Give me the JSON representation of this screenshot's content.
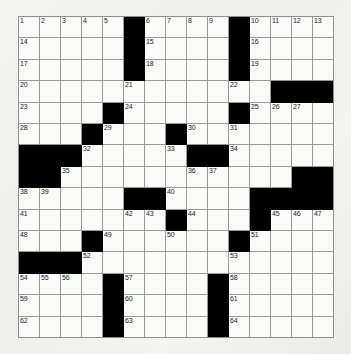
{
  "puzzle": {
    "title": "Crossword Puzzle Grid",
    "rows": 15,
    "columns": 15,
    "colors": {
      "block": "#000000",
      "cell": "#fafaf8",
      "gridline": "#9a9a9a",
      "page_background": "#f2f2f0",
      "number_text": "#222222"
    },
    "grid": [
      [
        {
          "type": "open",
          "number": "1"
        },
        {
          "type": "open",
          "number": "2"
        },
        {
          "type": "open",
          "number": "3"
        },
        {
          "type": "open",
          "number": "4"
        },
        {
          "type": "open",
          "number": "5"
        },
        {
          "type": "block",
          "number": ""
        },
        {
          "type": "open",
          "number": "6"
        },
        {
          "type": "open",
          "number": "7"
        },
        {
          "type": "open",
          "number": "8"
        },
        {
          "type": "open",
          "number": "9"
        },
        {
          "type": "block",
          "number": ""
        },
        {
          "type": "open",
          "number": "10"
        },
        {
          "type": "open",
          "number": "11"
        },
        {
          "type": "open",
          "number": "12"
        },
        {
          "type": "open",
          "number": "13"
        }
      ],
      [
        {
          "type": "open",
          "number": "14"
        },
        {
          "type": "open",
          "number": ""
        },
        {
          "type": "open",
          "number": ""
        },
        {
          "type": "open",
          "number": ""
        },
        {
          "type": "open",
          "number": ""
        },
        {
          "type": "block",
          "number": ""
        },
        {
          "type": "open",
          "number": "15"
        },
        {
          "type": "open",
          "number": ""
        },
        {
          "type": "open",
          "number": ""
        },
        {
          "type": "open",
          "number": ""
        },
        {
          "type": "block",
          "number": ""
        },
        {
          "type": "open",
          "number": "16"
        },
        {
          "type": "open",
          "number": ""
        },
        {
          "type": "open",
          "number": ""
        },
        {
          "type": "open",
          "number": ""
        }
      ],
      [
        {
          "type": "open",
          "number": "17"
        },
        {
          "type": "open",
          "number": ""
        },
        {
          "type": "open",
          "number": ""
        },
        {
          "type": "open",
          "number": ""
        },
        {
          "type": "open",
          "number": ""
        },
        {
          "type": "block",
          "number": ""
        },
        {
          "type": "open",
          "number": "18"
        },
        {
          "type": "open",
          "number": ""
        },
        {
          "type": "open",
          "number": ""
        },
        {
          "type": "open",
          "number": ""
        },
        {
          "type": "block",
          "number": ""
        },
        {
          "type": "open",
          "number": "19"
        },
        {
          "type": "open",
          "number": ""
        },
        {
          "type": "open",
          "number": ""
        },
        {
          "type": "open",
          "number": ""
        }
      ],
      [
        {
          "type": "open",
          "number": "20"
        },
        {
          "type": "open",
          "number": ""
        },
        {
          "type": "open",
          "number": ""
        },
        {
          "type": "open",
          "number": ""
        },
        {
          "type": "open",
          "number": ""
        },
        {
          "type": "open",
          "number": "21"
        },
        {
          "type": "open",
          "number": ""
        },
        {
          "type": "open",
          "number": ""
        },
        {
          "type": "open",
          "number": ""
        },
        {
          "type": "open",
          "number": ""
        },
        {
          "type": "open",
          "number": "22"
        },
        {
          "type": "open",
          "number": ""
        },
        {
          "type": "block",
          "number": ""
        },
        {
          "type": "block",
          "number": ""
        },
        {
          "type": "block",
          "number": ""
        }
      ],
      [
        {
          "type": "open",
          "number": "23"
        },
        {
          "type": "open",
          "number": ""
        },
        {
          "type": "open",
          "number": ""
        },
        {
          "type": "open",
          "number": ""
        },
        {
          "type": "block",
          "number": ""
        },
        {
          "type": "open",
          "number": "24"
        },
        {
          "type": "open",
          "number": ""
        },
        {
          "type": "open",
          "number": ""
        },
        {
          "type": "open",
          "number": ""
        },
        {
          "type": "open",
          "number": ""
        },
        {
          "type": "block",
          "number": ""
        },
        {
          "type": "open",
          "number": "25"
        },
        {
          "type": "open",
          "number": "26"
        },
        {
          "type": "open",
          "number": "27"
        },
        {
          "type": "open",
          "number": ""
        }
      ],
      [
        {
          "type": "open",
          "number": "28"
        },
        {
          "type": "open",
          "number": ""
        },
        {
          "type": "open",
          "number": ""
        },
        {
          "type": "block",
          "number": ""
        },
        {
          "type": "open",
          "number": "29"
        },
        {
          "type": "open",
          "number": ""
        },
        {
          "type": "open",
          "number": ""
        },
        {
          "type": "block",
          "number": ""
        },
        {
          "type": "open",
          "number": "30"
        },
        {
          "type": "open",
          "number": ""
        },
        {
          "type": "open",
          "number": "31"
        },
        {
          "type": "open",
          "number": ""
        },
        {
          "type": "open",
          "number": ""
        },
        {
          "type": "open",
          "number": ""
        },
        {
          "type": "open",
          "number": ""
        }
      ],
      [
        {
          "type": "block",
          "number": ""
        },
        {
          "type": "block",
          "number": ""
        },
        {
          "type": "block",
          "number": ""
        },
        {
          "type": "open",
          "number": "32"
        },
        {
          "type": "open",
          "number": ""
        },
        {
          "type": "open",
          "number": ""
        },
        {
          "type": "open",
          "number": ""
        },
        {
          "type": "open",
          "number": "33"
        },
        {
          "type": "block",
          "number": ""
        },
        {
          "type": "block",
          "number": ""
        },
        {
          "type": "open",
          "number": "34"
        },
        {
          "type": "open",
          "number": ""
        },
        {
          "type": "open",
          "number": ""
        },
        {
          "type": "open",
          "number": ""
        },
        {
          "type": "open",
          "number": ""
        }
      ],
      [
        {
          "type": "block",
          "number": ""
        },
        {
          "type": "block",
          "number": ""
        },
        {
          "type": "open",
          "number": "35"
        },
        {
          "type": "open",
          "number": ""
        },
        {
          "type": "open",
          "number": ""
        },
        {
          "type": "open",
          "number": ""
        },
        {
          "type": "open",
          "number": ""
        },
        {
          "type": "open",
          "number": ""
        },
        {
          "type": "open",
          "number": "36"
        },
        {
          "type": "open",
          "number": "37"
        },
        {
          "type": "open",
          "number": ""
        },
        {
          "type": "open",
          "number": ""
        },
        {
          "type": "open",
          "number": ""
        },
        {
          "type": "block",
          "number": ""
        },
        {
          "type": "block",
          "number": ""
        }
      ],
      [
        {
          "type": "open",
          "number": "38"
        },
        {
          "type": "open",
          "number": "39"
        },
        {
          "type": "open",
          "number": ""
        },
        {
          "type": "open",
          "number": ""
        },
        {
          "type": "open",
          "number": ""
        },
        {
          "type": "block",
          "number": ""
        },
        {
          "type": "block",
          "number": ""
        },
        {
          "type": "open",
          "number": "40"
        },
        {
          "type": "open",
          "number": ""
        },
        {
          "type": "open",
          "number": ""
        },
        {
          "type": "open",
          "number": ""
        },
        {
          "type": "block",
          "number": ""
        },
        {
          "type": "block",
          "number": ""
        },
        {
          "type": "block",
          "number": ""
        },
        {
          "type": "block",
          "number": ""
        }
      ],
      [
        {
          "type": "open",
          "number": "41"
        },
        {
          "type": "open",
          "number": ""
        },
        {
          "type": "open",
          "number": ""
        },
        {
          "type": "open",
          "number": ""
        },
        {
          "type": "open",
          "number": ""
        },
        {
          "type": "open",
          "number": "42"
        },
        {
          "type": "open",
          "number": "43"
        },
        {
          "type": "block",
          "number": ""
        },
        {
          "type": "open",
          "number": "44"
        },
        {
          "type": "open",
          "number": ""
        },
        {
          "type": "open",
          "number": ""
        },
        {
          "type": "block",
          "number": ""
        },
        {
          "type": "open",
          "number": "45"
        },
        {
          "type": "open",
          "number": "46"
        },
        {
          "type": "open",
          "number": "47"
        }
      ],
      [
        {
          "type": "open",
          "number": "48"
        },
        {
          "type": "open",
          "number": ""
        },
        {
          "type": "open",
          "number": ""
        },
        {
          "type": "block",
          "number": ""
        },
        {
          "type": "open",
          "number": "49"
        },
        {
          "type": "open",
          "number": ""
        },
        {
          "type": "open",
          "number": ""
        },
        {
          "type": "open",
          "number": "50"
        },
        {
          "type": "open",
          "number": ""
        },
        {
          "type": "open",
          "number": ""
        },
        {
          "type": "block",
          "number": ""
        },
        {
          "type": "open",
          "number": "51"
        },
        {
          "type": "open",
          "number": ""
        },
        {
          "type": "open",
          "number": ""
        },
        {
          "type": "open",
          "number": ""
        }
      ],
      [
        {
          "type": "block",
          "number": ""
        },
        {
          "type": "block",
          "number": ""
        },
        {
          "type": "block",
          "number": ""
        },
        {
          "type": "open",
          "number": "52"
        },
        {
          "type": "open",
          "number": ""
        },
        {
          "type": "open",
          "number": ""
        },
        {
          "type": "open",
          "number": ""
        },
        {
          "type": "open",
          "number": ""
        },
        {
          "type": "open",
          "number": ""
        },
        {
          "type": "open",
          "number": ""
        },
        {
          "type": "open",
          "number": "53"
        },
        {
          "type": "open",
          "number": ""
        },
        {
          "type": "open",
          "number": ""
        },
        {
          "type": "open",
          "number": ""
        },
        {
          "type": "open",
          "number": ""
        }
      ],
      [
        {
          "type": "open",
          "number": "54"
        },
        {
          "type": "open",
          "number": "55"
        },
        {
          "type": "open",
          "number": "56"
        },
        {
          "type": "open",
          "number": ""
        },
        {
          "type": "block",
          "number": ""
        },
        {
          "type": "open",
          "number": "57"
        },
        {
          "type": "open",
          "number": ""
        },
        {
          "type": "open",
          "number": ""
        },
        {
          "type": "open",
          "number": ""
        },
        {
          "type": "block",
          "number": ""
        },
        {
          "type": "open",
          "number": "58"
        },
        {
          "type": "open",
          "number": ""
        },
        {
          "type": "open",
          "number": ""
        },
        {
          "type": "open",
          "number": ""
        },
        {
          "type": "open",
          "number": ""
        }
      ],
      [
        {
          "type": "open",
          "number": "59"
        },
        {
          "type": "open",
          "number": ""
        },
        {
          "type": "open",
          "number": ""
        },
        {
          "type": "open",
          "number": ""
        },
        {
          "type": "block",
          "number": ""
        },
        {
          "type": "open",
          "number": "60"
        },
        {
          "type": "open",
          "number": ""
        },
        {
          "type": "open",
          "number": ""
        },
        {
          "type": "open",
          "number": ""
        },
        {
          "type": "block",
          "number": ""
        },
        {
          "type": "open",
          "number": "61"
        },
        {
          "type": "open",
          "number": ""
        },
        {
          "type": "open",
          "number": ""
        },
        {
          "type": "open",
          "number": ""
        },
        {
          "type": "open",
          "number": ""
        }
      ],
      [
        {
          "type": "open",
          "number": "62"
        },
        {
          "type": "open",
          "number": ""
        },
        {
          "type": "open",
          "number": ""
        },
        {
          "type": "open",
          "number": ""
        },
        {
          "type": "block",
          "number": ""
        },
        {
          "type": "open",
          "number": "63"
        },
        {
          "type": "open",
          "number": ""
        },
        {
          "type": "open",
          "number": ""
        },
        {
          "type": "open",
          "number": ""
        },
        {
          "type": "block",
          "number": ""
        },
        {
          "type": "open",
          "number": "64"
        },
        {
          "type": "open",
          "number": ""
        },
        {
          "type": "open",
          "number": ""
        },
        {
          "type": "open",
          "number": ""
        },
        {
          "type": "open",
          "number": ""
        }
      ]
    ]
  }
}
